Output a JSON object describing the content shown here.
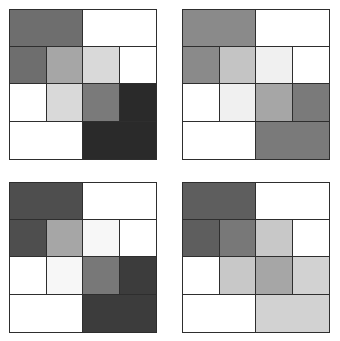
{
  "panels": [
    {
      "id": "top-left",
      "position": {
        "left": 9,
        "top": 9
      },
      "rows": [
        [
          "#6e6e6e",
          "#ffffff"
        ],
        [
          "#6e6e6e",
          "#a6a6a6",
          "#d9d9d9",
          "#ffffff"
        ],
        [
          "#ffffff",
          "#d9d9d9",
          "#7a7a7a",
          "#2a2a2a"
        ],
        [
          "#ffffff",
          "#2a2a2a"
        ]
      ]
    },
    {
      "id": "top-right",
      "position": {
        "left": 182,
        "top": 9
      },
      "rows": [
        [
          "#8a8a8a",
          "#ffffff"
        ],
        [
          "#8a8a8a",
          "#c4c4c4",
          "#f0f0f0",
          "#ffffff"
        ],
        [
          "#ffffff",
          "#f0f0f0",
          "#a6a6a6",
          "#7a7a7a"
        ],
        [
          "#ffffff",
          "#7a7a7a"
        ]
      ]
    },
    {
      "id": "bottom-left",
      "position": {
        "left": 9,
        "top": 182
      },
      "rows": [
        [
          "#4e4e4e",
          "#ffffff"
        ],
        [
          "#4e4e4e",
          "#a6a6a6",
          "#f7f7f7",
          "#ffffff"
        ],
        [
          "#ffffff",
          "#f7f7f7",
          "#787878",
          "#3c3c3c"
        ],
        [
          "#ffffff",
          "#3c3c3c"
        ]
      ]
    },
    {
      "id": "bottom-right",
      "position": {
        "left": 182,
        "top": 182
      },
      "rows": [
        [
          "#5e5e5e",
          "#ffffff"
        ],
        [
          "#5e5e5e",
          "#787878",
          "#c8c8c8",
          "#ffffff"
        ],
        [
          "#ffffff",
          "#c8c8c8",
          "#a6a6a6",
          "#d2d2d2"
        ],
        [
          "#ffffff",
          "#d2d2d2"
        ]
      ]
    }
  ],
  "row_layout": [
    "half",
    "quarter",
    "quarter",
    "half"
  ]
}
